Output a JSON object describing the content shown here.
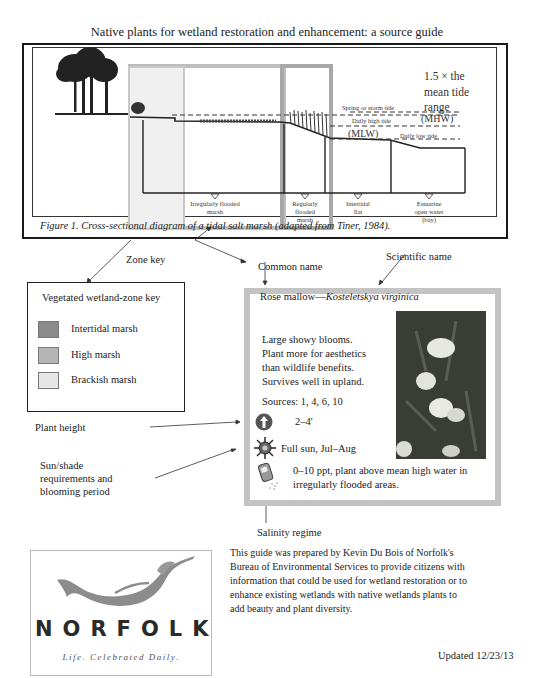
{
  "page_title": "Native plants for wetland restoration and enhancement: a source guide",
  "figure": {
    "caption": "Figure 1. Cross-sectional diagram of a tidal salt marsh (adapted from Tiner, 1984).",
    "tide_note": [
      "1.5 × the",
      "mean tide",
      "range"
    ],
    "tide_lines": {
      "spring": "Spring or storm tide",
      "daily_high": "Daily high tide",
      "mhw": "(MHW)",
      "mlw": "(MLW)",
      "daily_low": "Daily low tide"
    },
    "zones": [
      {
        "label_lines": [
          "Irregularly flooded",
          "marsh"
        ]
      },
      {
        "label_lines": [
          "Regularly",
          "flooded",
          "marsh"
        ]
      },
      {
        "label_lines": [
          "Intertidal",
          "flat"
        ]
      },
      {
        "label_lines": [
          "Estuarine",
          "open water",
          "(bay)"
        ]
      }
    ]
  },
  "annotations": {
    "zone_key": "Zone key",
    "common_name": "Common name",
    "scientific_name": "Scientific name",
    "plant_height": "Plant height",
    "sun_shade": [
      "Sun/shade",
      "requirements and",
      "blooming period"
    ],
    "salinity": "Salinity regime"
  },
  "zone_key": {
    "title": "Vegetated wetland-zone key",
    "items": [
      {
        "label": "Intertidal marsh",
        "color": "#8a8a8a"
      },
      {
        "label": "High marsh",
        "color": "#b5b5b5"
      },
      {
        "label": "Brackish marsh",
        "color": "#e6e6e6"
      }
    ]
  },
  "plant": {
    "common_name": "Rose mallow",
    "separator": "—",
    "scientific_name": "Kosteletskya virginica",
    "description": [
      "Large showy blooms.",
      "Plant more for aesthetics",
      "than wildlife benefits.",
      "Survives well in upland."
    ],
    "sources": "Sources: 1, 4, 6, 10",
    "height": "2–4'",
    "sun": "Full sun, Jul–Aug",
    "salinity": [
      "0–10 ppt, plant above mean high water in",
      "irregularly flooded areas."
    ]
  },
  "footer": {
    "logo_text": "NORFOLK",
    "logo_tagline": "Life. Celebrated Daily.",
    "credit": "This guide was prepared by Kevin Du Bois of Norfolk's Bureau of Environmental Services to provide citizens with information that could be used for wetland restoration or to enhance existing wetlands with native wetlands plants to add beauty and plant diversity.",
    "updated": "Updated 12/23/13"
  }
}
